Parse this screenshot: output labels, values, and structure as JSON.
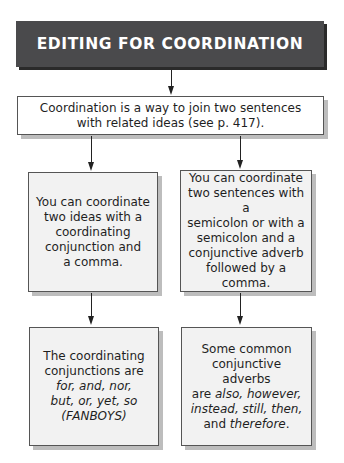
{
  "header": {
    "title": "EDITING FOR COORDINATION"
  },
  "intro": {
    "line1": "Coordination is a way to join two sentences",
    "line2": "with related ideas (see p. 417)."
  },
  "left_column": {
    "middle": {
      "lines": [
        "You can coordinate",
        "two ideas with a",
        "coordinating",
        "conjunction and",
        "a comma."
      ]
    },
    "bottom": {
      "line1": "The coordinating",
      "line2": "conjunctions are",
      "line3_italic": "for, and, nor,",
      "line4_italic": "but, or, yet, so",
      "line5_italic": "(FANBOYS)"
    }
  },
  "right_column": {
    "middle": {
      "lines": [
        "You can coordinate",
        "two sentences with a",
        "semicolon or with a",
        "semicolon and a",
        "conjunctive adverb",
        "followed by a comma."
      ]
    },
    "bottom": {
      "line1": "Some common",
      "line2": "conjunctive adverbs",
      "line3_prefix": "are ",
      "line3_italic": "also, however,",
      "line4_italic": "instead, still, then,",
      "line5_prefix": "and ",
      "line5_italic": "therefore",
      "line5_suffix": "."
    }
  },
  "colors": {
    "header_bg": "#4a4a4c",
    "header_text": "#ffffff",
    "box_bg": "#f2f2f2",
    "box_shadow": "#bdbdbd",
    "border": "#555555"
  }
}
